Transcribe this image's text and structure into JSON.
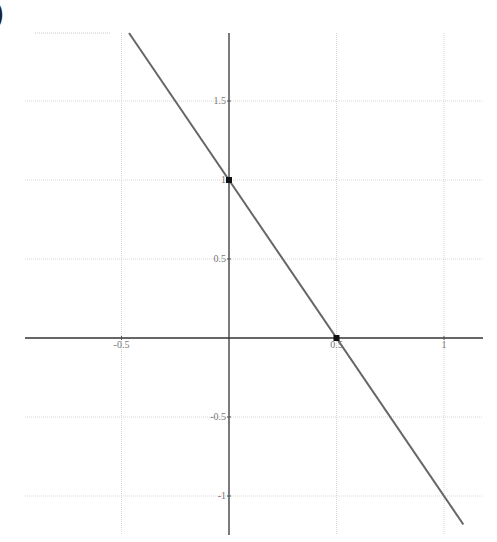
{
  "panel_label": ")",
  "chart_data": {
    "type": "line",
    "title": "",
    "xlabel": "",
    "ylabel": "",
    "xlim": [
      -0.95,
      1.18
    ],
    "ylim": [
      -1.2,
      1.93
    ],
    "grid": true,
    "x_ticks": [
      {
        "value": -0.5,
        "label": "-0.5"
      },
      {
        "value": 0.5,
        "label": "0.5"
      },
      {
        "value": 1,
        "label": "1"
      }
    ],
    "y_ticks": [
      {
        "value": 1.5,
        "label": "1.5"
      },
      {
        "value": 1,
        "label": "1"
      },
      {
        "value": 0.5,
        "label": "0.5"
      },
      {
        "value": -0.5,
        "label": "-0.5"
      },
      {
        "value": -1,
        "label": "-1"
      }
    ],
    "series": [
      {
        "name": "y = 1 - 2x",
        "x": [
          -0.465,
          1.09
        ],
        "y": [
          1.93,
          -1.18
        ],
        "color": "#666666"
      }
    ],
    "points": [
      {
        "x": 0,
        "y": 1
      },
      {
        "x": 0.5,
        "y": 0
      }
    ],
    "colors": {
      "axis": "#333333",
      "grid": "#d8d8d8",
      "line": "#666666",
      "point": "#111111"
    }
  }
}
